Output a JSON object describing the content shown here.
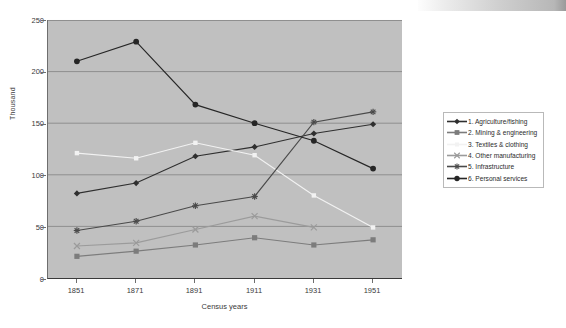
{
  "chart_data": {
    "type": "line",
    "title": "",
    "xlabel": "Census years",
    "ylabel": "Thousand",
    "categories": [
      "1851",
      "1871",
      "1891",
      "1911",
      "1931",
      "1951"
    ],
    "ylim": [
      0,
      250
    ],
    "yticks": [
      0,
      50,
      100,
      150,
      200,
      250
    ],
    "grid": true,
    "legend_position": "right",
    "series": [
      {
        "name": "1. Agriculture/fishing",
        "marker": "diamond",
        "color": "#2f2f2f",
        "values": [
          82,
          92,
          118,
          127,
          140,
          149
        ]
      },
      {
        "name": "2. Mining & engineering",
        "marker": "square",
        "color": "#7c7c7c",
        "values": [
          21,
          26,
          32,
          39,
          32,
          37
        ]
      },
      {
        "name": "3. Textiles & clothing",
        "marker": "small-square",
        "color": "#f2f2f2",
        "values": [
          121,
          116,
          131,
          119,
          80,
          49
        ]
      },
      {
        "name": "4. Other manufacturing",
        "marker": "cross",
        "color": "#9b9b9b",
        "values": [
          31,
          34,
          47,
          60,
          49,
          null
        ]
      },
      {
        "name": "5. Infrastructure",
        "marker": "asterisk",
        "color": "#4a4a4a",
        "values": [
          46,
          55,
          70,
          79,
          151,
          161
        ]
      },
      {
        "name": "6. Personal services",
        "marker": "circle",
        "color": "#262626",
        "values": [
          210,
          229,
          168,
          150,
          133,
          106
        ]
      }
    ]
  },
  "axes": {
    "y_tick_labels": [
      "250",
      "200",
      "150",
      "100",
      "50",
      "0"
    ],
    "y_axis_title": "Thousand",
    "x_tick_labels": [
      "1851",
      "1871",
      "1891",
      "1911",
      "1931",
      "1951"
    ],
    "x_axis_title": "Census years"
  },
  "legend": {
    "items": [
      {
        "label": "1. Agriculture/fishing"
      },
      {
        "label": "2. Mining & engineering"
      },
      {
        "label": "3. Textiles & clothing"
      },
      {
        "label": "4. Other manufacturing"
      },
      {
        "label": "5. Infrastructure"
      },
      {
        "label": "6. Personal services"
      }
    ]
  },
  "colors": {
    "plot_background": "#c0c0c0",
    "page_background": "#ffffff",
    "gridline": "#8f8f8f",
    "axis": "#6e6e6e"
  }
}
